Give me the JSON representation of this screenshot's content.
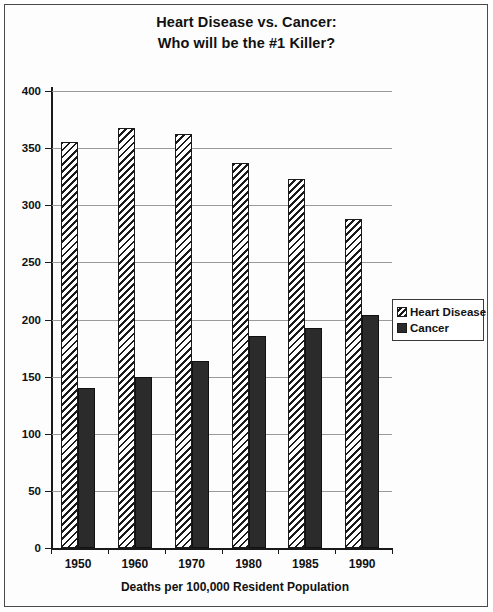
{
  "chart_data": {
    "type": "bar",
    "title": "Heart Disease vs. Cancer:",
    "subtitle": "Who will be the #1 Killer?",
    "title_lines": [
      "Heart Disease vs. Cancer:",
      "Who will be the #1 Killer?"
    ],
    "categories": [
      "1950",
      "1960",
      "1970",
      "1980",
      "1985",
      "1990"
    ],
    "series": [
      {
        "name": "Heart Disease",
        "fill": "diagonal-hatch",
        "color": "#1a1a1a",
        "values": [
          355,
          368,
          362,
          337,
          323,
          288
        ]
      },
      {
        "name": "Cancer",
        "fill": "solid",
        "color": "#2b2b2b",
        "values": [
          140,
          150,
          164,
          186,
          193,
          204
        ]
      }
    ],
    "xlabel": "Deaths per 100,000 Resident Population",
    "ylabel": "",
    "ylim": [
      0,
      400
    ],
    "ytick_step": 50,
    "yticks": [
      0,
      50,
      100,
      150,
      200,
      250,
      300,
      350,
      400
    ],
    "ytick_labels": [
      "0",
      "50",
      "100",
      "150",
      "200",
      "250",
      "300",
      "350",
      "400"
    ],
    "grid": true,
    "grid_axis": "y",
    "legend_position": "right",
    "legend_entries": [
      "Heart Disease",
      "Cancer"
    ]
  },
  "caption": {
    "text": "Deaths per 100,000 Resident Population"
  }
}
